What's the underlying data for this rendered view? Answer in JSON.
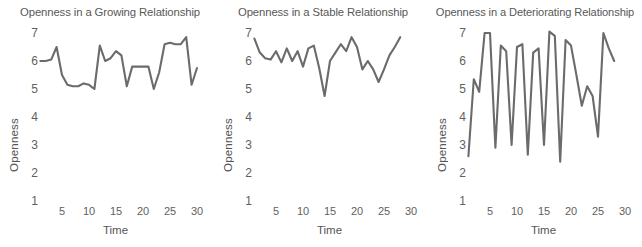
{
  "figure": {
    "background": "#ffffff",
    "line_color": "#6b6b6b",
    "text_color": "#585858"
  },
  "axis": {
    "ylabel": "Openness",
    "xlabel": "Time",
    "yticks": [
      "1",
      "2",
      "3",
      "4",
      "5",
      "6",
      "7"
    ],
    "xticks": [
      "5",
      "10",
      "15",
      "20",
      "25",
      "30"
    ]
  },
  "chart_data": [
    {
      "type": "line",
      "title": "Openness in a Growing Relationship",
      "xlabel": "Time",
      "ylabel": "Openness",
      "xlim": [
        1,
        31
      ],
      "ylim": [
        1,
        7
      ],
      "grid": false,
      "legend": "none",
      "x": [
        1,
        2,
        3,
        4,
        5,
        6,
        7,
        8,
        9,
        10,
        11,
        12,
        13,
        14,
        15,
        16,
        17,
        18,
        19,
        20,
        21,
        22,
        23,
        24,
        25,
        26,
        27,
        28,
        29,
        30
      ],
      "values": [
        6.0,
        6.0,
        6.05,
        6.5,
        5.5,
        5.15,
        5.1,
        5.1,
        5.2,
        5.15,
        5.0,
        6.55,
        6.0,
        6.1,
        6.35,
        6.2,
        5.1,
        5.8,
        5.8,
        5.8,
        5.8,
        5.0,
        5.6,
        6.6,
        6.65,
        6.6,
        6.6,
        6.85,
        5.15,
        5.75
      ]
    },
    {
      "type": "line",
      "title": "Openness in a Stable Relationship",
      "xlabel": "Time",
      "ylabel": "Openness",
      "xlim": [
        1,
        31
      ],
      "ylim": [
        1,
        7
      ],
      "grid": false,
      "legend": "none",
      "x": [
        1,
        2,
        3,
        4,
        5,
        6,
        7,
        8,
        9,
        10,
        11,
        12,
        13,
        14,
        15,
        16,
        17,
        18,
        19,
        20,
        21,
        22,
        23,
        24,
        25,
        26,
        27,
        28
      ],
      "values": [
        6.8,
        6.3,
        6.1,
        6.05,
        6.35,
        5.95,
        6.45,
        6.0,
        6.35,
        5.8,
        6.45,
        6.55,
        5.75,
        4.75,
        6.0,
        6.3,
        6.6,
        6.35,
        6.85,
        6.5,
        5.7,
        6.0,
        5.7,
        5.25,
        5.7,
        6.2,
        6.5,
        6.85
      ]
    },
    {
      "type": "line",
      "title": "Openness in a Deteriorating Relationship",
      "xlabel": "Time",
      "ylabel": "Openness",
      "xlim": [
        1,
        31
      ],
      "ylim": [
        1,
        7
      ],
      "grid": false,
      "legend": "none",
      "x": [
        1,
        2,
        3,
        4,
        5,
        6,
        7,
        8,
        9,
        10,
        11,
        12,
        13,
        14,
        15,
        16,
        17,
        18,
        19,
        20,
        21,
        22,
        23,
        24,
        25,
        26,
        27,
        28
      ],
      "values": [
        2.6,
        5.35,
        4.9,
        7.0,
        7.0,
        2.9,
        6.55,
        6.35,
        3.0,
        6.5,
        6.6,
        2.65,
        6.3,
        6.45,
        3.0,
        7.05,
        6.9,
        2.4,
        6.75,
        6.55,
        5.5,
        4.4,
        5.1,
        4.75,
        3.3,
        7.0,
        6.45,
        6.0
      ]
    }
  ]
}
